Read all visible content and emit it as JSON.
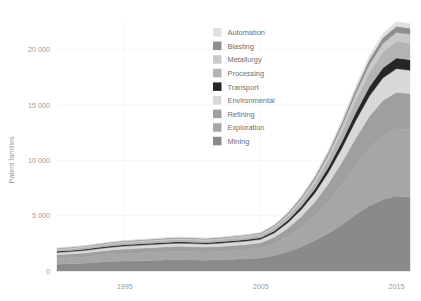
{
  "chart_data": {
    "type": "area",
    "stacked": true,
    "title": "",
    "xlabel": "",
    "ylabel": "Patent families",
    "xlim": [
      1990,
      2016
    ],
    "ylim": [
      0,
      22500
    ],
    "xticks": [
      1995,
      2005,
      2015
    ],
    "xtick_labels": [
      "1995",
      "2005",
      "2015"
    ],
    "yticks": [
      0,
      5000,
      10000,
      15000,
      20000
    ],
    "ytick_labels": [
      "0",
      "5 000",
      "10 000",
      "15 000",
      "20 000"
    ],
    "grid": true,
    "legend_position": "upper-center",
    "x": [
      1990,
      1991,
      1992,
      1993,
      1994,
      1995,
      1996,
      1997,
      1998,
      1999,
      2000,
      2001,
      2002,
      2003,
      2004,
      2005,
      2006,
      2007,
      2008,
      2009,
      2010,
      2011,
      2012,
      2013,
      2014,
      2015,
      2016
    ],
    "series": [
      {
        "name": "Mining",
        "color": "#8a8a8a",
        "values": [
          620,
          660,
          700,
          780,
          850,
          900,
          930,
          960,
          1000,
          1020,
          1000,
          980,
          1010,
          1060,
          1100,
          1180,
          1400,
          1750,
          2200,
          2750,
          3400,
          4200,
          5100,
          5900,
          6450,
          6750,
          6700
        ]
      },
      {
        "name": "Exploration",
        "color": "#a6a6a6",
        "values": [
          520,
          540,
          570,
          610,
          650,
          680,
          700,
          720,
          740,
          760,
          750,
          740,
          760,
          790,
          820,
          870,
          1050,
          1350,
          1750,
          2250,
          2900,
          3650,
          4450,
          5200,
          5800,
          6100,
          6050
        ]
      },
      {
        "name": "Refining",
        "color": "#9f9f9f",
        "values": [
          330,
          340,
          355,
          375,
          395,
          410,
          420,
          430,
          440,
          450,
          445,
          440,
          450,
          465,
          480,
          500,
          600,
          760,
          980,
          1250,
          1600,
          2000,
          2450,
          2850,
          3150,
          3300,
          3280
        ]
      },
      {
        "name": "Environmental",
        "color": "#d8d8d8",
        "values": [
          210,
          218,
          228,
          240,
          252,
          262,
          268,
          274,
          280,
          286,
          282,
          278,
          285,
          295,
          305,
          320,
          385,
          490,
          630,
          805,
          1030,
          1290,
          1580,
          1840,
          2030,
          2130,
          2110
        ]
      },
      {
        "name": "Transport",
        "color": "#262626",
        "values": [
          95,
          98,
          102,
          108,
          113,
          118,
          120,
          123,
          126,
          129,
          127,
          125,
          128,
          133,
          137,
          144,
          173,
          220,
          283,
          362,
          463,
          580,
          710,
          826,
          912,
          957,
          948
        ]
      },
      {
        "name": "Processing",
        "color": "#b4b4b4",
        "values": [
          150,
          155,
          162,
          171,
          180,
          187,
          191,
          195,
          200,
          204,
          201,
          198,
          203,
          210,
          217,
          228,
          274,
          349,
          449,
          574,
          734,
          920,
          1126,
          1310,
          1446,
          1517,
          1503
        ]
      },
      {
        "name": "Metallurgy",
        "color": "#c9c9c9",
        "values": [
          80,
          83,
          86,
          91,
          96,
          100,
          102,
          104,
          107,
          109,
          107,
          106,
          108,
          112,
          116,
          122,
          146,
          186,
          239,
          306,
          391,
          490,
          600,
          698,
          770,
          808,
          801
        ]
      },
      {
        "name": "Blasting",
        "color": "#8f8f8f",
        "values": [
          55,
          57,
          59,
          62,
          66,
          68,
          70,
          71,
          73,
          75,
          74,
          73,
          74,
          77,
          80,
          84,
          100,
          128,
          164,
          210,
          268,
          336,
          412,
          479,
          528,
          554,
          549
        ]
      },
      {
        "name": "Automation",
        "color": "#e0e0e0",
        "values": [
          40,
          41,
          43,
          45,
          48,
          50,
          51,
          52,
          53,
          54,
          53,
          53,
          54,
          56,
          58,
          61,
          73,
          93,
          119,
          153,
          195,
          244,
          299,
          348,
          384,
          403,
          399
        ]
      }
    ],
    "totals_note": ""
  },
  "legend": {
    "items": [
      {
        "label": "Automation",
        "color": "#e0e0e0"
      },
      {
        "label": "Blasting",
        "color": "#8f8f8f"
      },
      {
        "label": "Metallurgy",
        "color": "#c9c9c9"
      },
      {
        "label": "Processing",
        "color": "#b4b4b4"
      },
      {
        "label": "Transport",
        "color": "#262626"
      },
      {
        "label": "Environmental",
        "color": "#d8d8d8"
      },
      {
        "label": "Refining",
        "color": "#9f9f9f"
      },
      {
        "label": "Exploration",
        "color": "#a6a6a6"
      },
      {
        "label": "Mining",
        "color": "#8a8a8a"
      }
    ]
  },
  "colors": {
    "background": "#ffffff",
    "grid": "#f2f2f2",
    "tick_text": "#9a9a9a",
    "legend_text": "#6e6e6e"
  }
}
